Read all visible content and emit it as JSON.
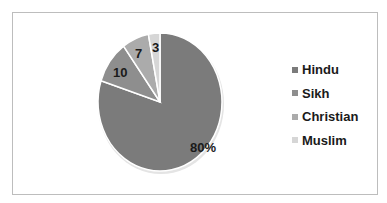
{
  "chart_data": {
    "type": "pie",
    "title": "",
    "categories": [
      "Hindu",
      "Sikh",
      "Christian",
      "Muslim"
    ],
    "values": [
      80,
      10,
      7,
      3
    ],
    "data_labels": [
      "80%",
      "10",
      "7",
      "3"
    ],
    "colors": [
      "#7b7b7b",
      "#8e8e8e",
      "#ababab",
      "#d6d6d6"
    ],
    "legend_position": "right",
    "start_angle_deg": 0,
    "direction": "clockwise"
  },
  "legend": {
    "items": [
      {
        "label": "Hindu",
        "color": "#7b7b7b"
      },
      {
        "label": "Sikh",
        "color": "#8e8e8e"
      },
      {
        "label": "Christian",
        "color": "#ababab"
      },
      {
        "label": "Muslim",
        "color": "#d6d6d6"
      }
    ]
  },
  "labels": {
    "hindu": "80%",
    "sikh": "10",
    "christian": "7",
    "muslim": "3"
  }
}
